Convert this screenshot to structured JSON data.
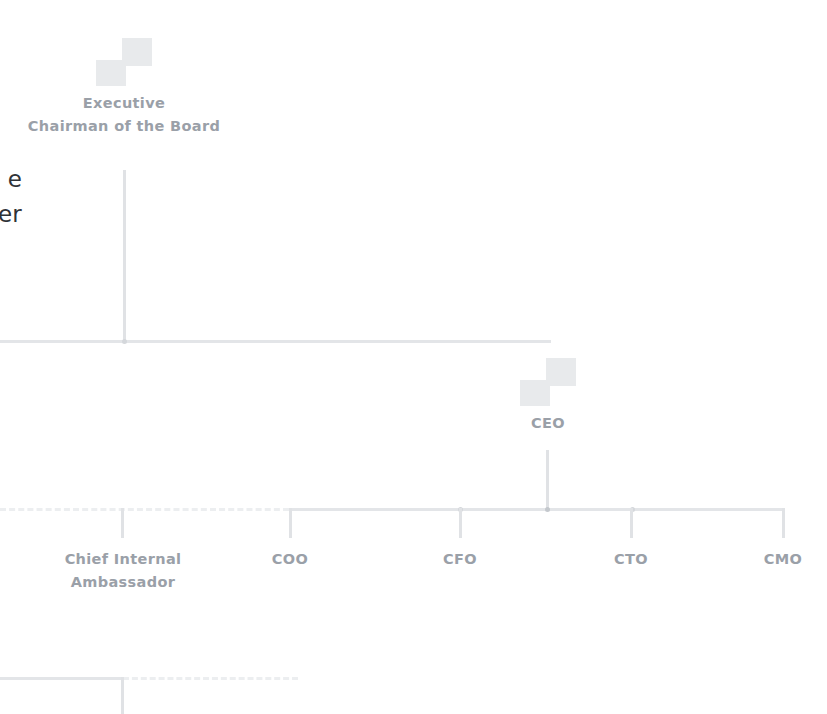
{
  "canvas": {
    "width": 827,
    "height": 714,
    "background": "#ffffff"
  },
  "theme": {
    "label_color": "#9aa0a8",
    "heading_color": "#2f3237",
    "connector_solid": "#e3e5e8",
    "connector_dashed": "#eceef0",
    "avatar_fill": "#e8eaec",
    "junction_color": "#d4d7db"
  },
  "edge_heading": {
    "line1": "e",
    "line2": "er",
    "note": "text clipped by left edge of viewport"
  },
  "nodes": {
    "chairman": {
      "label_line1": "Executive",
      "label_line2": "Chairman of the Board",
      "avatar_icon": "person-avatar-icon"
    },
    "ceo": {
      "label": "CEO",
      "avatar_icon": "person-avatar-icon"
    },
    "ambassador": {
      "label_line1": "Chief Internal",
      "label_line2": "Ambassador"
    },
    "coo": {
      "label": "COO"
    },
    "cfo": {
      "label": "CFO"
    },
    "cto": {
      "label": "CTO"
    },
    "cmo": {
      "label": "CMO"
    }
  }
}
